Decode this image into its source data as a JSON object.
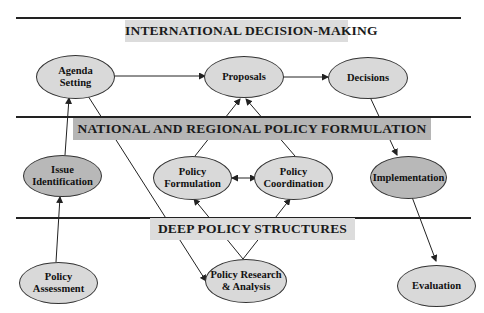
{
  "layers": {
    "international": {
      "label": "INTERNATIONAL DECISION-MAKING",
      "color": "#dcdcdc"
    },
    "national": {
      "label": "NATIONAL AND REGIONAL POLICY FORMULATION",
      "color": "#b5b5b5"
    },
    "deep": {
      "label": "DEEP POLICY STRUCTURES",
      "color": "#dcdcdc"
    }
  },
  "nodes": {
    "agenda_setting": "Agenda\nSetting",
    "proposals": "Proposals",
    "decisions": "Decisions",
    "issue_identification": "Issue\nIdentification",
    "policy_formulation": "Policy\nFormulation",
    "policy_coordination": "Policy\nCoordination",
    "implementation": "Implementation",
    "policy_assessment": "Policy\nAssessment",
    "policy_research": "Policy Research\n& Analysis",
    "evaluation": "Evaluation"
  },
  "edges": [
    {
      "from": "Agenda Setting",
      "to": "Proposals"
    },
    {
      "from": "Proposals",
      "to": "Decisions"
    },
    {
      "from": "Decisions",
      "to": "Implementation"
    },
    {
      "from": "Implementation",
      "to": "Evaluation"
    },
    {
      "from": "Issue Identification",
      "to": "Agenda Setting"
    },
    {
      "from": "Policy Assessment",
      "to": "Issue Identification"
    },
    {
      "from": "Agenda Setting",
      "to": "Policy Research & Analysis"
    },
    {
      "from": "Policy Formulation",
      "to": "Proposals"
    },
    {
      "from": "Policy Coordination",
      "to": "Proposals"
    },
    {
      "from": "Policy Formulation",
      "to": "Policy Coordination",
      "bidirectional": true
    },
    {
      "from": "Policy Research & Analysis",
      "to": "Policy Formulation"
    },
    {
      "from": "Policy Research & Analysis",
      "to": "Policy Coordination"
    }
  ],
  "colors": {
    "node_fill": "#d9d9d9",
    "node_fill_dark": "#b8b8b8",
    "line": "#222222"
  }
}
